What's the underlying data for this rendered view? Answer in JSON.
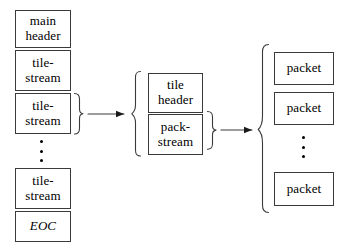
{
  "diagram": {
    "background_color": "#ffffff",
    "stroke_color": "#3a3a3a",
    "text_color": "#000000",
    "columns": {
      "codestream": {
        "name": "codestream",
        "boxes": [
          {
            "id": "main-header",
            "line1": "main",
            "line2": "header",
            "style": "normal"
          },
          {
            "id": "tile-stream-1",
            "line1": "tile-",
            "line2": "stream",
            "style": "normal"
          },
          {
            "id": "tile-stream-2",
            "line1": "tile-",
            "line2": "stream",
            "style": "normal"
          },
          {
            "id": "tile-stream-n",
            "line1": "tile-",
            "line2": "stream",
            "style": "normal"
          },
          {
            "id": "eoc",
            "line1": "EOC",
            "line2": "",
            "style": "italic"
          }
        ],
        "ellipsis": "⋮"
      },
      "tilestream": {
        "name": "tile-stream",
        "boxes": [
          {
            "id": "tile-header",
            "line1": "tile",
            "line2": "header",
            "style": "normal"
          },
          {
            "id": "pack-stream",
            "line1": "pack-",
            "line2": "stream",
            "style": "normal"
          }
        ]
      },
      "packstream": {
        "name": "pack-stream",
        "boxes": [
          {
            "id": "packet-1",
            "line1": "packet",
            "line2": "",
            "style": "normal"
          },
          {
            "id": "packet-2",
            "line1": "packet",
            "line2": "",
            "style": "normal"
          },
          {
            "id": "packet-n",
            "line1": "packet",
            "line2": "",
            "style": "normal"
          }
        ],
        "ellipsis": "⋮"
      }
    },
    "connectors": [
      {
        "id": "tilestream-expansion-arrow",
        "from": "tile-stream-2",
        "to": "tilestream-group"
      },
      {
        "id": "packstream-expansion-arrow",
        "from": "pack-stream",
        "to": "packstream-group"
      }
    ]
  }
}
